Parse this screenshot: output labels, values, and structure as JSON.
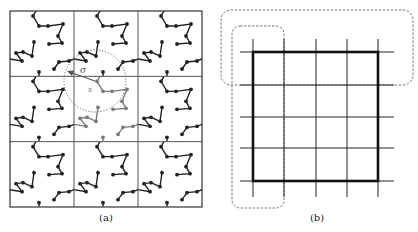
{
  "panels": {
    "a": {
      "caption": "(a)",
      "caption_x": 106,
      "box": {
        "x": 10,
        "y": 11,
        "w": 192,
        "h": 196
      },
      "grid": {
        "cols": 3,
        "rows": 3
      },
      "center_cell": {
        "col": 1,
        "row": 1
      },
      "chains": [
        [
          [
            26,
            0
          ],
          [
            23,
            5
          ],
          [
            29,
            15
          ],
          [
            38,
            15
          ],
          [
            53,
            13
          ],
          [
            48,
            25
          ],
          [
            52,
            32
          ],
          [
            39,
            33
          ]
        ],
        [
          [
            24,
            31
          ],
          [
            22,
            45
          ],
          [
            13,
            41
          ],
          [
            6,
            42
          ],
          [
            12,
            50
          ],
          [
            0,
            48
          ]
        ],
        [
          [
            64,
            48
          ],
          [
            59,
            50
          ],
          [
            49,
            51
          ],
          [
            44,
            58
          ]
        ],
        [
          [
            29,
            61
          ],
          [
            29,
            65
          ]
        ]
      ],
      "beads": [
        [
          23,
          5
        ],
        [
          29,
          15
        ],
        [
          38,
          15
        ],
        [
          53,
          13
        ],
        [
          48,
          25
        ],
        [
          52,
          32
        ],
        [
          39,
          33
        ],
        [
          24,
          31
        ],
        [
          22,
          45
        ],
        [
          13,
          41
        ],
        [
          6,
          42
        ],
        [
          12,
          50
        ],
        [
          59,
          50
        ],
        [
          49,
          51
        ],
        [
          44,
          58
        ],
        [
          29,
          61
        ]
      ],
      "interaction_circle": {
        "cx": 95,
        "cy": 81,
        "r": 31
      },
      "arrow": {
        "x1": 95,
        "y1": 81,
        "x2": 67,
        "y2": 71
      },
      "labels": {
        "sigma": "σ",
        "s": "s"
      },
      "colors": {
        "chain": "#222222",
        "highlight": "#7a7a7a",
        "grid": "#555555"
      }
    },
    "b": {
      "caption": "(b)",
      "caption_x": 317,
      "vlines_x": [
        253,
        284,
        316,
        347,
        378
      ],
      "hlines_y": [
        52,
        85,
        117,
        148,
        181
      ],
      "vline_span": [
        39,
        197
      ],
      "hline_span": [
        240,
        394
      ],
      "thick_box": {
        "x": 253,
        "y": 52,
        "w": 125,
        "h": 129
      },
      "dashed_regions": [
        {
          "name": "row-region",
          "x": 221,
          "y": 10,
          "w": 192,
          "h": 75,
          "rx": 10
        },
        {
          "name": "column-region",
          "x": 232,
          "y": 26,
          "w": 52,
          "h": 182,
          "rx": 8
        }
      ],
      "colors": {
        "line": "#222222",
        "dash": "#777777"
      }
    }
  }
}
